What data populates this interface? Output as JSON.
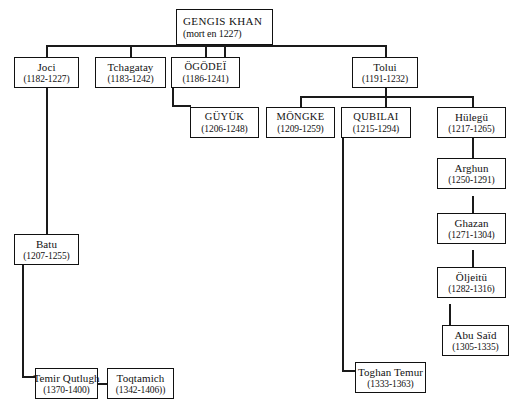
{
  "diagram": {
    "nodes": {
      "gengis": {
        "name": "GENGIS KHAN",
        "years": "(mort en 1227)"
      },
      "joci": {
        "name": "Joci",
        "years": "(1182-1227)"
      },
      "tchagatay": {
        "name": "Tchagatay",
        "years": "(1183-1242)"
      },
      "ogodei": {
        "name": "ÖGÖDEÏ",
        "years": "(1186-1241)"
      },
      "tolui": {
        "name": "Tolui",
        "years": "(1191-1232)"
      },
      "guyuk": {
        "name": "GÜYÜK",
        "years": "(1206-1248)"
      },
      "mongke": {
        "name": "MÖNGKE",
        "years": "(1209-1259)"
      },
      "qubilai": {
        "name": "QUBILAI",
        "years": "(1215-1294)"
      },
      "hulegu": {
        "name": "Hülegü",
        "years": "(1217-1265)"
      },
      "arghun": {
        "name": "Arghun",
        "years": "(1250-1291)"
      },
      "ghazan": {
        "name": "Ghazan",
        "years": "(1271-1304)"
      },
      "oljeitu": {
        "name": "Öljeitü",
        "years": "(1282-1316)"
      },
      "abusaid": {
        "name": "Abu Saïd",
        "years": "(1305-1335)"
      },
      "batu": {
        "name": "Batu",
        "years": "(1207-1255)"
      },
      "temir": {
        "name": "Temir Qutlugh",
        "years": "(1370-1400)"
      },
      "toqtamich": {
        "name": "Toqtamich",
        "years": "(1342-1406))"
      },
      "toghan": {
        "name": "Toghan Temur",
        "years": "(1333-1363)"
      }
    }
  }
}
